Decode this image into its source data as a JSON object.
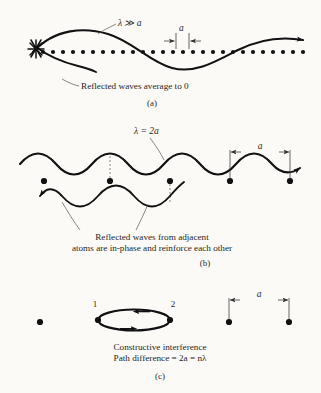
{
  "figure": {
    "background_color": "#fbfaf7",
    "ink_color": "#111111",
    "panels": [
      {
        "id": "a",
        "label": "(a)",
        "wavelength_label": "λ ≫ a",
        "spacing_label": "a",
        "caption": "Reflected waves average to 0",
        "atom_count": 27,
        "atom_size": "small"
      },
      {
        "id": "b",
        "label": "(b)",
        "wavelength_label": "λ = 2a",
        "spacing_label": "a",
        "caption_line1": "Reflected waves from adjacent",
        "caption_line2": "atoms are in-phase and reinforce each other",
        "atom_count": 6,
        "atom_size": "large"
      },
      {
        "id": "c",
        "label": "(c)",
        "spacing_label": "a",
        "path_label_left": "1",
        "path_label_right": "2",
        "caption_line1": "Constructive interference",
        "caption_line2": "Path difference = 2a = nλ",
        "atom_count": 3,
        "atom_size": "large"
      }
    ]
  }
}
